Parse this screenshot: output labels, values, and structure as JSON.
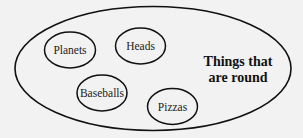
{
  "diagram": {
    "background": "#f2f2f2",
    "outer_set": {
      "label_line1": "Things that",
      "label_line2": "are round"
    },
    "members": [
      {
        "label": "Planets"
      },
      {
        "label": "Heads"
      },
      {
        "label": "Baseballs"
      },
      {
        "label": "Pizzas"
      }
    ]
  }
}
